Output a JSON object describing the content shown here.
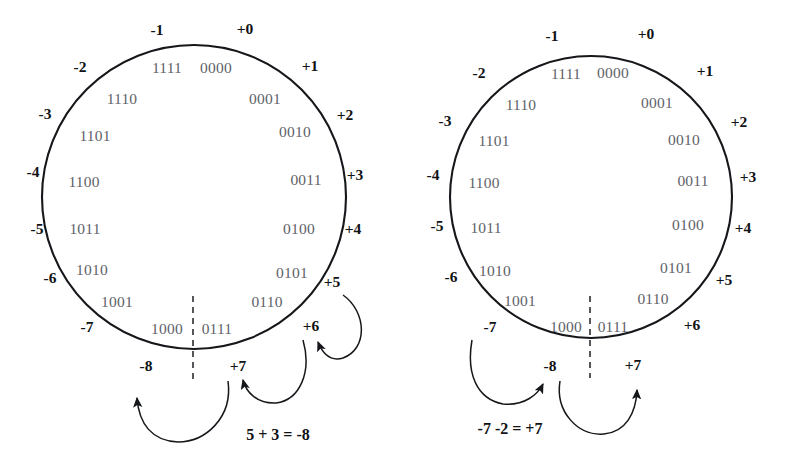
{
  "figure": {
    "background_color": "#ffffff",
    "binary_label_color": "#5f6368",
    "decimal_label_color": "#101214",
    "stroke_color": "#15171a"
  },
  "wheel_labels": {
    "binary": [
      "0000",
      "0001",
      "0010",
      "0011",
      "0100",
      "0101",
      "0110",
      "0111",
      "1000",
      "1001",
      "1010",
      "1011",
      "1100",
      "1101",
      "1110",
      "1111"
    ],
    "decimal": [
      "+0",
      "+1",
      "+2",
      "+3",
      "+4",
      "+5",
      "+6",
      "+7",
      "-8",
      "-7",
      "-6",
      "-5",
      "-4",
      "-3",
      "-2",
      "-1"
    ]
  },
  "diagrams": [
    {
      "name": "addition-overflow-wheel",
      "center_x": 194,
      "center_y": 197,
      "radius": 152,
      "divider": {
        "x": 193,
        "y_top": 296,
        "y_bottom": 382
      },
      "caption": "5 + 3 = -8",
      "caption_x": 278,
      "caption_y": 440,
      "steps": [
        {
          "from": "+5",
          "to": "+6"
        },
        {
          "from": "+6",
          "to": "+7"
        },
        {
          "from": "+7",
          "to": "-8"
        }
      ],
      "arrow_count": 3
    },
    {
      "name": "subtraction-overflow-wheel",
      "center_x": 591,
      "center_y": 197,
      "radius": 141,
      "divider": {
        "x": 590,
        "y_top": 296,
        "y_bottom": 378
      },
      "caption": "-7 -2 = +7",
      "caption_x": 455,
      "caption_y": 434,
      "steps": [
        {
          "from": "-7",
          "to": "-8"
        },
        {
          "from": "-8",
          "to": "+7"
        }
      ],
      "arrow_count": 2
    }
  ]
}
